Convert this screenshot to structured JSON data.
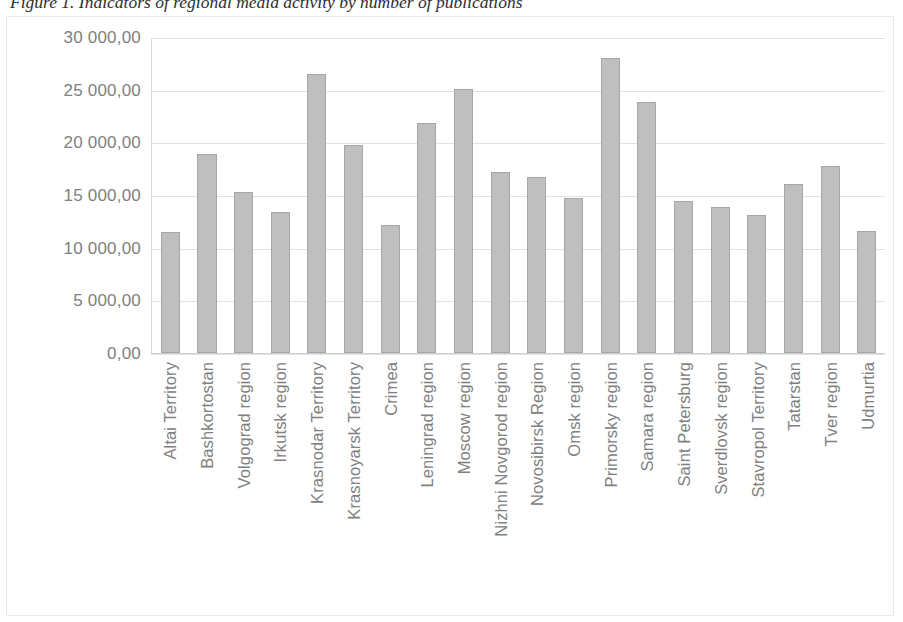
{
  "figure": {
    "caption": "Figure 1. Indicators of regional media activity by number of publications"
  },
  "chart_data": {
    "type": "bar",
    "title": "Figure 1. Indicators of regional media activity by number of publications",
    "xlabel": "",
    "ylabel": "",
    "ylim": [
      0,
      30000
    ],
    "ytick_labels": [
      "30 000,00",
      "25 000,00",
      "20 000,00",
      "15 000,00",
      "10 000,00",
      "5 000,00",
      "0,00"
    ],
    "ytick_values": [
      30000,
      25000,
      20000,
      15000,
      10000,
      5000,
      0
    ],
    "grid": true,
    "legend": false,
    "bar_color": "#bfbfbf",
    "bar_border_color": "#a6a6a6",
    "gridline_color": "#e2e2e2",
    "label_color": "#808080",
    "categories": [
      "Altai Territory",
      "Bashkortostan",
      "Volgograd region",
      "Irkutsk region",
      "Krasnodar Territory",
      "Krasnoyarsk Territory",
      "Crimea",
      "Leningrad region",
      "Moscow region",
      "Nizhni Novgorod region",
      "Novosibirsk Region",
      "Omsk region",
      "Primorsky region",
      "Samara region",
      "Saint Petersburg",
      "Sverdlovsk region",
      "Stavropol Territory",
      "Tatarstan",
      "Tver region",
      "Udmurtia"
    ],
    "values": [
      11500,
      19000,
      15350,
      13450,
      26550,
      19800,
      12200,
      21900,
      25100,
      17200,
      16800,
      14800,
      28100,
      23900,
      14500,
      13950,
      13150,
      16050,
      17800,
      11650
    ]
  }
}
